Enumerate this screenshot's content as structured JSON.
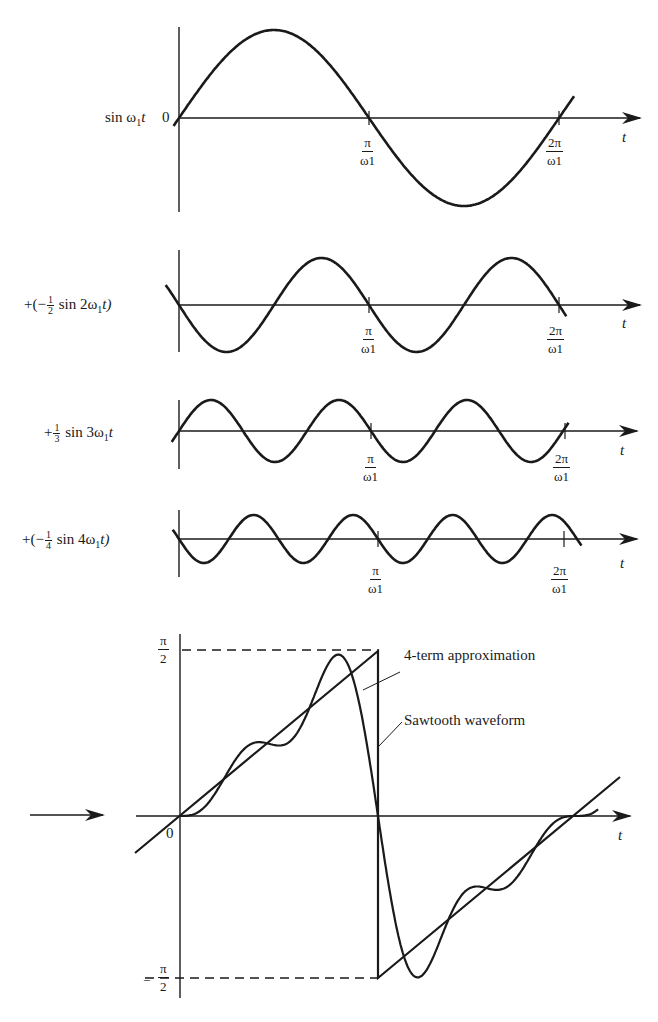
{
  "figure": {
    "panels": [
      {
        "id": "sin1",
        "label_parts": [
          "sin ω",
          "1",
          "t"
        ],
        "label_text": "sin ω1t",
        "coefficient": 1,
        "harmonic": 1,
        "origin_label": "0",
        "tick_labels": [
          {
            "num": "π",
            "den": "ω1"
          },
          {
            "num": "2π",
            "den": "ω1"
          }
        ],
        "axis_label": "t"
      },
      {
        "id": "sin2",
        "label_prefix": "+(−",
        "label_frac": {
          "num": "1",
          "den": "2"
        },
        "label_suffix": " sin 2ω",
        "label_sub": "1",
        "label_end": "t)",
        "label_text": "+(−½ sin 2ω1t)",
        "coefficient": -0.5,
        "harmonic": 2,
        "tick_labels": [
          {
            "num": "π",
            "den": "ω1"
          },
          {
            "num": "2π",
            "den": "ω1"
          }
        ],
        "axis_label": "t"
      },
      {
        "id": "sin3",
        "label_prefix": "+",
        "label_frac": {
          "num": "1",
          "den": "3"
        },
        "label_suffix": " sin 3ω",
        "label_sub": "1",
        "label_end": "t",
        "label_text": "+⅓ sin 3ω1t",
        "coefficient": 0.3333,
        "harmonic": 3,
        "tick_labels": [
          {
            "num": "π",
            "den": "ω1"
          },
          {
            "num": "2π",
            "den": "ω1"
          }
        ],
        "axis_label": "t"
      },
      {
        "id": "sin4",
        "label_prefix": "+(−",
        "label_frac": {
          "num": "1",
          "den": "4"
        },
        "label_suffix": " sin 4ω",
        "label_sub": "1",
        "label_end": "t)",
        "label_text": "+(−¼ sin 4ω1t)",
        "coefficient": -0.25,
        "harmonic": 4,
        "tick_labels": [
          {
            "num": "π",
            "den": "ω1"
          },
          {
            "num": "2π",
            "den": "ω1"
          }
        ],
        "axis_label": "t"
      }
    ],
    "result": {
      "y_top_label": {
        "num": "π",
        "den": "2"
      },
      "y_bottom_label": {
        "sign": "−",
        "num": "π",
        "den": "2"
      },
      "origin_label": "0",
      "axis_label": "t",
      "callouts": [
        "4-term approximation",
        "Sawtooth waveform"
      ]
    }
  },
  "style": {
    "stroke": "#1a1a1a",
    "background": "#ffffff"
  }
}
